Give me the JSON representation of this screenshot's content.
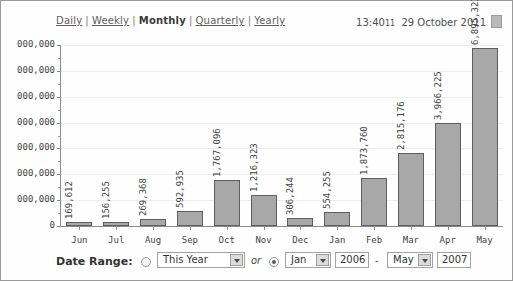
{
  "nav": {
    "items": [
      {
        "label": "Daily",
        "active": false
      },
      {
        "label": "Weekly",
        "active": false
      },
      {
        "label": "Monthly",
        "active": true
      },
      {
        "label": "Quarterly",
        "active": false
      },
      {
        "label": "Yearly",
        "active": false
      }
    ],
    "separator": "|"
  },
  "timestamp": {
    "time": "13:40",
    "seconds": "11",
    "date": "29 October 2011",
    "icon": "page-icon"
  },
  "chart_data": {
    "type": "bar",
    "title": "",
    "xlabel": "",
    "ylabel": "",
    "categories": [
      "Jun",
      "Jul",
      "Aug",
      "Sep",
      "Oct",
      "Nov",
      "Dec",
      "Jan",
      "Feb",
      "Mar",
      "Apr",
      "May"
    ],
    "values": [
      169612,
      156255,
      269368,
      592935,
      1767096,
      1216323,
      306244,
      554255,
      1873760,
      2815176,
      3966225,
      6895323
    ],
    "value_labels": [
      "169,612",
      "156,255",
      "269,368",
      "592,935",
      "1,767,096",
      "1,216,323",
      "306,244",
      "554,255",
      "1,873,760",
      "2,815,176",
      "3,966,225",
      "6,895,323"
    ],
    "ylim": [
      0,
      7000000
    ],
    "ytick_values": [
      0,
      1000000,
      2000000,
      3000000,
      4000000,
      5000000,
      6000000,
      7000000
    ],
    "ytick_labels": [
      "0",
      "000,000",
      "000,000",
      "000,000",
      "000,000",
      "000,000",
      "000,000",
      "000,000"
    ],
    "grid": true,
    "legend": "none",
    "bar_color": "#a8a8a8",
    "bar_border_color": "#5f5f5f"
  },
  "controls": {
    "date_range_label": "Date Range:",
    "preset_radio_checked": false,
    "preset_select": {
      "value": "This Year",
      "options": [
        "This Year",
        "Last Year",
        "This Month",
        "Last Month"
      ]
    },
    "conjunction": "or",
    "custom_radio_checked": true,
    "from_month_select": {
      "value": "Jan",
      "options": [
        "Jan",
        "Feb",
        "Mar",
        "Apr",
        "May",
        "Jun",
        "Jul",
        "Aug",
        "Sep",
        "Oct",
        "Nov",
        "Dec"
      ]
    },
    "from_year": "2006",
    "range_dash": "-",
    "to_month_select": {
      "value": "May",
      "options": [
        "Jan",
        "Feb",
        "Mar",
        "Apr",
        "May",
        "Jun",
        "Jul",
        "Aug",
        "Sep",
        "Oct",
        "Nov",
        "Dec"
      ]
    },
    "to_year": "2007"
  }
}
